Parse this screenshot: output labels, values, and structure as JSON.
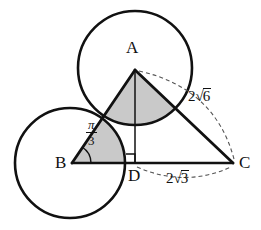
{
  "figure": {
    "background": "#ffffff",
    "stroke_color": "#111111",
    "shade_color": "#c8c8c8",
    "dash_color": "#555555",
    "width": 261,
    "height": 230
  },
  "points": {
    "A": {
      "label": "A",
      "x": 135,
      "y": 70,
      "label_x": 126,
      "label_y": 39
    },
    "B": {
      "label": "B",
      "x": 72,
      "y": 163,
      "label_x": 55,
      "label_y": 154
    },
    "C": {
      "label": "C",
      "x": 233,
      "y": 163,
      "label_x": 239,
      "label_y": 154
    },
    "D": {
      "label": "D",
      "x": 135,
      "y": 163,
      "label_x": 128,
      "label_y": 167
    }
  },
  "circles": [
    {
      "name": "circle-at-A",
      "cx": 135,
      "cy": 68,
      "r": 57
    },
    {
      "name": "circle-at-B",
      "cx": 70,
      "cy": 163,
      "r": 55
    }
  ],
  "angle": {
    "name": "angle-B",
    "numerator": "π",
    "denominator": "3",
    "label_x": 86,
    "label_y": 124
  },
  "right_angle": {
    "name": "right-angle-at-D",
    "x": 135,
    "y": 163,
    "size": 9
  },
  "measures": [
    {
      "name": "length-AC",
      "coefficient": "2",
      "radicand": "6",
      "text": "2√6",
      "label_x": 188,
      "label_y": 95
    },
    {
      "name": "length-DC",
      "coefficient": "2",
      "radicand": "3",
      "text": "2√3",
      "label_x": 166,
      "label_y": 177
    }
  ],
  "segments": [
    {
      "name": "side-AB",
      "from": "A",
      "to": "B"
    },
    {
      "name": "side-AC",
      "from": "A",
      "to": "C"
    },
    {
      "name": "side-BC",
      "from": "B",
      "to": "C"
    },
    {
      "name": "altitude-AD",
      "from": "A",
      "to": "D"
    }
  ],
  "dashed_arcs": [
    {
      "name": "arc-measure-AC",
      "from": "A",
      "to": "C"
    },
    {
      "name": "arc-measure-DC",
      "from": "D",
      "to": "C"
    }
  ]
}
